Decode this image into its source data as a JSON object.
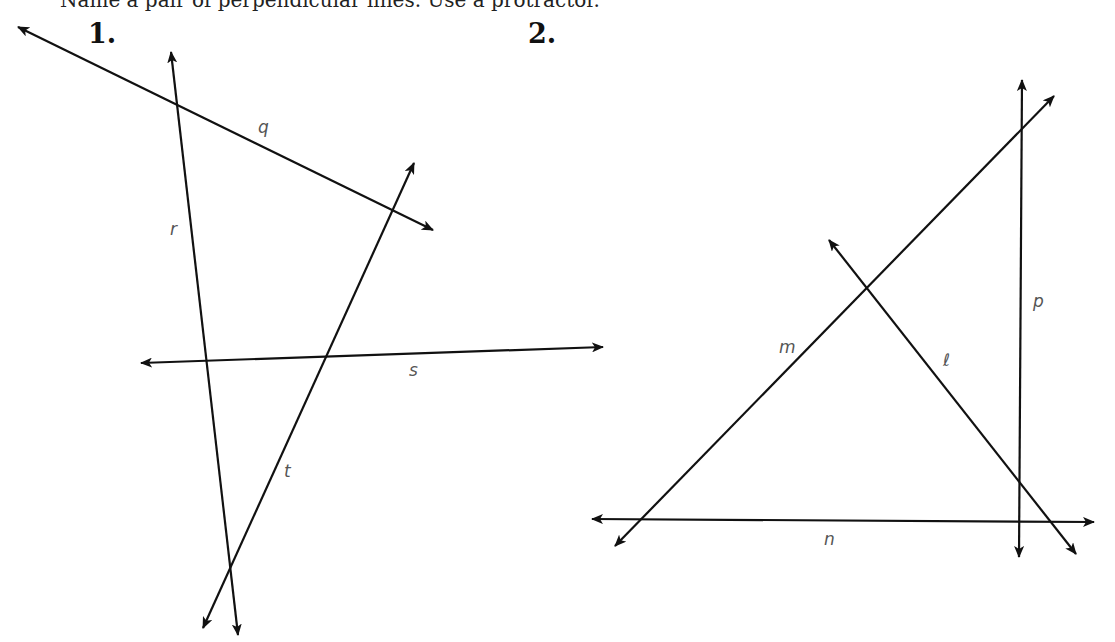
{
  "header": {
    "clipped_instruction": "Name a pair of perpendicular lines. Use a protractor."
  },
  "figures": [
    {
      "number": "1.",
      "lines": [
        {
          "name": "q",
          "label": "q",
          "x1": 18,
          "y1": 27,
          "x2": 433,
          "y2": 230
        },
        {
          "name": "r",
          "label": "r",
          "x1": 171,
          "y1": 52,
          "x2": 238,
          "y2": 635
        },
        {
          "name": "t",
          "label": "t",
          "x1": 414,
          "y1": 163,
          "x2": 203,
          "y2": 628
        },
        {
          "name": "s",
          "label": "s",
          "x1": 141,
          "y1": 363,
          "x2": 603,
          "y2": 347
        }
      ]
    },
    {
      "number": "2.",
      "lines": [
        {
          "name": "p",
          "label": "p",
          "x1": 1022,
          "y1": 80,
          "x2": 1019,
          "y2": 557
        },
        {
          "name": "m",
          "label": "m",
          "x1": 1054,
          "y1": 96,
          "x2": 615,
          "y2": 546
        },
        {
          "name": "l",
          "label": "ℓ",
          "x1": 829,
          "y1": 240,
          "x2": 1076,
          "y2": 554
        },
        {
          "name": "n",
          "label": "n",
          "x1": 592,
          "y1": 519,
          "x2": 1094,
          "y2": 522
        }
      ]
    }
  ],
  "colors": {
    "line": "#111111",
    "label": "#555555",
    "background": "#ffffff"
  }
}
